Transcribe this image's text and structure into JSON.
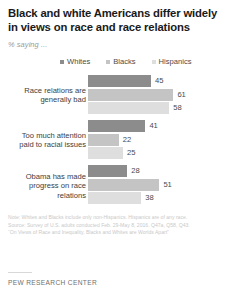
{
  "header": {
    "title": "Black and white Americans differ widely in views on race and race relations",
    "subtitle": "% saying ..."
  },
  "legend": {
    "items": [
      {
        "label": "Whites",
        "color": "#8c8c8c"
      },
      {
        "label": "Blacks",
        "color": "#c4c4c4"
      },
      {
        "label": "Hispanics",
        "color": "#dedede"
      }
    ]
  },
  "footer": {
    "note": "Note: Whites and Blacks include only non-Hispanics. Hispanics are of any race.",
    "source": "Source: Survey of U.S. adults conducted Feb. 29-May 8, 2016. Q47a, Q58, Q43.",
    "report": "“On Views of Race and Inequality, Blacks and Whites are Worlds Apart”",
    "brand": "PEW RESEARCH CENTER"
  },
  "chart_data": {
    "type": "bar",
    "orientation": "horizontal",
    "title": "Black and white Americans differ widely in views on race and race relations",
    "subtitle": "% saying ...",
    "xlabel": "",
    "ylabel": "",
    "xlim": [
      0,
      100
    ],
    "grid": false,
    "legend_position": "top",
    "categories": [
      "Race relations are generally bad",
      "Too much attention paid to racial issues",
      "Obama has made progress on race relations"
    ],
    "series": [
      {
        "name": "Whites",
        "color": "#8c8c8c",
        "values": [
          45,
          41,
          28
        ]
      },
      {
        "name": "Blacks",
        "color": "#c4c4c4",
        "values": [
          61,
          22,
          51
        ]
      },
      {
        "name": "Hispanics",
        "color": "#dedede",
        "values": [
          58,
          25,
          38
        ]
      }
    ],
    "groups": [
      {
        "label_line1": "Race relations are",
        "label_line2": "generally bad",
        "bars": [
          {
            "series": "Whites",
            "value": 45,
            "value_label": "45",
            "color": "#8c8c8c"
          },
          {
            "series": "Blacks",
            "value": 61,
            "value_label": "61",
            "color": "#c4c4c4"
          },
          {
            "series": "Hispanics",
            "value": 58,
            "value_label": "58",
            "color": "#dedede"
          }
        ]
      },
      {
        "label_line1": "Too much attention",
        "label_line2": "paid to racial issues",
        "bars": [
          {
            "series": "Whites",
            "value": 41,
            "value_label": "41",
            "color": "#8c8c8c"
          },
          {
            "series": "Blacks",
            "value": 22,
            "value_label": "22",
            "color": "#c4c4c4"
          },
          {
            "series": "Hispanics",
            "value": 25,
            "value_label": "25",
            "color": "#dedede"
          }
        ]
      },
      {
        "label_line1": "Obama has made",
        "label_line2": "progress on race",
        "label_line3": "relations",
        "bars": [
          {
            "series": "Whites",
            "value": 28,
            "value_label": "28",
            "color": "#8c8c8c"
          },
          {
            "series": "Blacks",
            "value": 51,
            "value_label": "51",
            "color": "#c4c4c4"
          },
          {
            "series": "Hispanics",
            "value": 38,
            "value_label": "38",
            "color": "#dedede"
          }
        ]
      }
    ]
  }
}
